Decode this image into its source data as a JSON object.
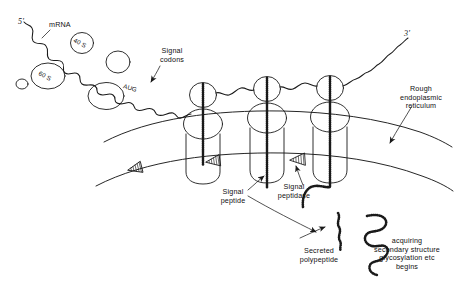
{
  "figure": {
    "ink_color": "#1a1a1a",
    "background_color": "#ffffff"
  },
  "labels": {
    "five_prime": "5'",
    "three_prime": "3'",
    "mrna": "mRNA",
    "small_subunit": "40 S",
    "large_subunit": "60 S",
    "start_codon": "AUG",
    "signal_codons_line1": "Signal",
    "signal_codons_line2": "codons",
    "rough_er_line1": "Rough",
    "rough_er_line2": "endoplasmic",
    "rough_er_line3": "reticulum",
    "signal_peptide_line1": "Signal",
    "signal_peptide_line2": "peptide",
    "signal_peptidase_line1": "Signal",
    "signal_peptidase_line2": "peptidase",
    "secreted_line1": "Secreted",
    "secreted_line2": "polypeptide",
    "acquiring_line1": "acquiring",
    "acquiring_line2": "secondary structure",
    "acquiring_line3": "glycosylation etc",
    "acquiring_line4": "begins"
  },
  "diagram_elements": {
    "ribosome_count": 3,
    "free_subunits_unlabeled": 3,
    "free_subunits_labeled": 2,
    "signal_peptidase_arrowheads": 3,
    "secreted_polypeptides": 2,
    "membrane_lines": 2
  }
}
